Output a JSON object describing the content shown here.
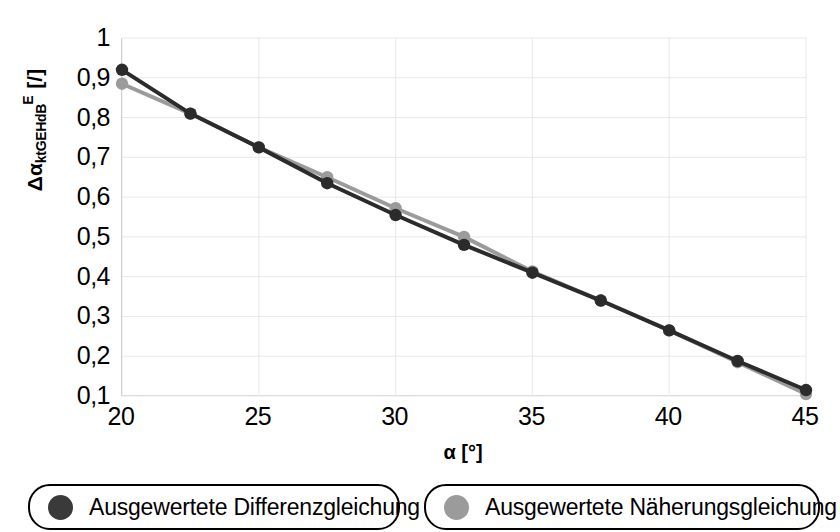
{
  "chart_data": {
    "type": "line",
    "title": "",
    "xlabel": "α [°]",
    "ylabel": "ΔαktGEHdB E [/]",
    "ylabel_parts": {
      "base": "Δα",
      "subscript": "ktGEHdB",
      "superscript": "E",
      "unit": "[/]"
    },
    "xlim": [
      20,
      45
    ],
    "ylim": [
      0.1,
      1.0
    ],
    "xticks": [
      "20",
      "25",
      "30",
      "35",
      "40",
      "45"
    ],
    "xtick_values": [
      20,
      25,
      30,
      35,
      40,
      45
    ],
    "yticks": [
      "0,1",
      "0,2",
      "0,3",
      "0,4",
      "0,5",
      "0,6",
      "0,7",
      "0,8",
      "0,9",
      "1"
    ],
    "ytick_values": [
      0.1,
      0.2,
      0.3,
      0.4,
      0.5,
      0.6,
      0.7,
      0.8,
      0.9,
      1.0
    ],
    "grid": true,
    "grid_color": "#e8e8e8",
    "legend_position": "bottom",
    "x": [
      20,
      22.5,
      25,
      27.5,
      30,
      32.5,
      35,
      37.5,
      40,
      42.5,
      45
    ],
    "series": [
      {
        "name": "Ausgewertete Differenzgleichung",
        "color": "#2b2b2b",
        "marker": "circle",
        "values": [
          0.92,
          0.81,
          0.725,
          0.635,
          0.555,
          0.48,
          0.41,
          0.34,
          0.265,
          0.188,
          0.115
        ]
      },
      {
        "name": "Ausgewertete Näherungsgleichung",
        "color": "#9b9b9b",
        "marker": "circle",
        "values": [
          0.885,
          0.81,
          0.725,
          0.65,
          0.572,
          0.5,
          0.413,
          0.34,
          0.265,
          0.185,
          0.105
        ]
      }
    ]
  },
  "legend": {
    "items": [
      {
        "label": "Ausgewertete Differenzgleichung",
        "color": "#3a3a3a"
      },
      {
        "label": "Ausgewertete Näherungsgleichung",
        "color": "#9b9b9b"
      }
    ]
  }
}
